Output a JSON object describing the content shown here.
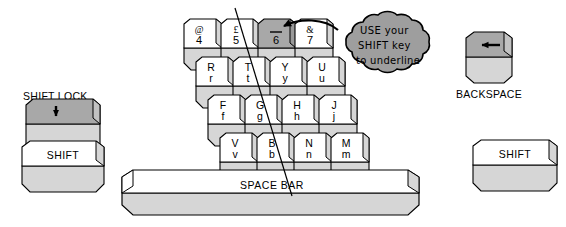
{
  "diagram": {
    "background_color": "#ffffff",
    "ink_color": "#000000",
    "key_face_color": "#ffffff",
    "key_side_color": "#d6d6d6",
    "key_highlight_color": "#a8a8a8",
    "cloud_fill_color": "#9e9e9e"
  },
  "callout": {
    "line1": "USE your",
    "line2": "SHIFT key",
    "line3": "to underline",
    "arrow_target": "6"
  },
  "number_row": [
    {
      "upper": "@",
      "lower": "4",
      "highlighted": false
    },
    {
      "upper": "£",
      "lower": "5",
      "highlighted": false
    },
    {
      "upper": "—",
      "lower": "6",
      "highlighted": true
    },
    {
      "upper": "&",
      "lower": "7",
      "highlighted": false
    }
  ],
  "top_letter_row": [
    {
      "upper": "R",
      "lower": "r"
    },
    {
      "upper": "T",
      "lower": "t"
    },
    {
      "upper": "Y",
      "lower": "y"
    },
    {
      "upper": "U",
      "lower": "u"
    }
  ],
  "home_letter_row": [
    {
      "upper": "F",
      "lower": "f"
    },
    {
      "upper": "G",
      "lower": "g"
    },
    {
      "upper": "H",
      "lower": "h"
    },
    {
      "upper": "J",
      "lower": "j"
    }
  ],
  "bottom_letter_row": [
    {
      "upper": "V",
      "lower": "v"
    },
    {
      "upper": "B",
      "lower": "b"
    },
    {
      "upper": "N",
      "lower": "n"
    },
    {
      "upper": "M",
      "lower": "m"
    }
  ],
  "space_bar": {
    "label": "SPACE BAR"
  },
  "left_keys": {
    "shift_lock_label": "SHIFT LOCK",
    "shift_lock_icon": "down-arrow-icon",
    "shift_label": "SHIFT"
  },
  "right_keys": {
    "backspace_label": "BACKSPACE",
    "backspace_icon": "left-arrow-icon",
    "shift_label": "SHIFT"
  }
}
